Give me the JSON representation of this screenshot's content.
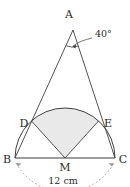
{
  "figure": {
    "vertices": {
      "A": "A",
      "B": "B",
      "C": "C",
      "D": "D",
      "E": "E",
      "M": "M"
    },
    "angle": {
      "value": "40",
      "unit": "°",
      "label": "40°",
      "at_vertex": "A"
    },
    "dimension": {
      "label": "12 cm",
      "value": "12",
      "unit": "cm",
      "between": "B-C"
    },
    "colors": {
      "stroke": "#3a3a3a",
      "shaded_fill": "#e8e8e8",
      "dimension_stroke": "#8c8c8c",
      "background": "#ffffff"
    },
    "geometry": {
      "A": [
        73,
        30
      ],
      "B": [
        15,
        158
      ],
      "C": [
        115,
        158
      ],
      "M": [
        65,
        158
      ],
      "D": [
        31.5,
        128
      ],
      "E": [
        101,
        128
      ],
      "radius": 50
    }
  }
}
